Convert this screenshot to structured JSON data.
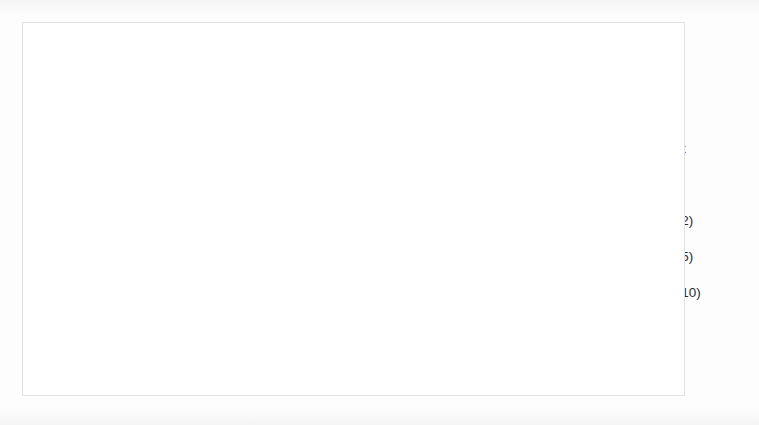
{
  "chart_data": {
    "type": "line",
    "title": "",
    "subtitle": "",
    "xlabel": "episodes",
    "ylabel": "rewards",
    "xlim": [
      0,
      40000
    ],
    "ylim": [
      0,
      1800
    ],
    "grid": false,
    "legend_position": "right",
    "xticks": [
      "0",
      "5000",
      "10000",
      "15000",
      "20000",
      "25000",
      "30000",
      "35000",
      "40000"
    ],
    "xtick_values": [
      0,
      5000,
      10000,
      15000,
      20000,
      25000,
      30000,
      35000,
      40000
    ],
    "yticks": [
      "0",
      "200",
      "400",
      "600",
      "800",
      "1000",
      "1200",
      "1400",
      "1600",
      "1800"
    ],
    "ytick_values": [
      0,
      200,
      400,
      600,
      800,
      1000,
      1200,
      1400,
      1600,
      1800
    ],
    "x": [
      0,
      2500,
      5000,
      7500,
      10000,
      12500,
      15000,
      17500,
      20000,
      22500,
      25000,
      27500,
      30000,
      32500,
      35000,
      37500,
      40000
    ],
    "series": [
      {
        "name": "IDQN",
        "color": "#595959",
        "values": [
          10,
          120,
          230,
          290,
          300,
          340,
          370,
          390,
          430,
          470,
          500,
          520,
          520,
          530,
          505,
          535,
          465
        ]
      },
      {
        "name": "BiCNet",
        "color": "#7a7a7a",
        "values": [
          370,
          680,
          880,
          1030,
          1015,
          1090,
          1105,
          1130,
          1150,
          1210,
          1250,
          1230,
          1215,
          1240,
          1225,
          1190,
          1280
        ]
      },
      {
        "name": "Our",
        "color": "#b8b8b8",
        "values": [
          15,
          330,
          630,
          650,
          870,
          1000,
          1080,
          1150,
          1195,
          1240,
          1260,
          1235,
          1205,
          1210,
          1180,
          1165,
          1195
        ]
      },
      {
        "name": "Our(tr.2)",
        "color": "#8c8c8c",
        "values": [
          10,
          300,
          610,
          640,
          845,
          910,
          1045,
          1125,
          1215,
          1260,
          1320,
          1250,
          1230,
          1245,
          1200,
          1185,
          1210
        ]
      },
      {
        "name": "Our(tr.5)",
        "color": "#cfcfcf",
        "values": [
          1030,
          1085,
          1105,
          1150,
          1195,
          1200,
          1240,
          1290,
          1330,
          1375,
          1395,
          1430,
          1440,
          1455,
          1450,
          1445,
          1460
        ]
      },
      {
        "name": "Our(tr.10)",
        "color": "#bdbdbd",
        "values": [
          1185,
          1240,
          1210,
          1300,
          1305,
          1335,
          1315,
          1355,
          1380,
          1400,
          1430,
          1420,
          1465,
          1470,
          1490,
          1470,
          1540
        ]
      }
    ]
  },
  "legend": {
    "items": [
      {
        "label": "IDQN",
        "color": "#595959"
      },
      {
        "label": "BiCNet",
        "color": "#7a7a7a"
      },
      {
        "label": "Our",
        "color": "#b8b8b8"
      },
      {
        "label": "Our(tr.2)",
        "color": "#8c8c8c"
      },
      {
        "label": "Our(tr.5)",
        "color": "#cfcfcf"
      },
      {
        "label": "Our(tr.10)",
        "color": "#bdbdbd"
      }
    ]
  }
}
